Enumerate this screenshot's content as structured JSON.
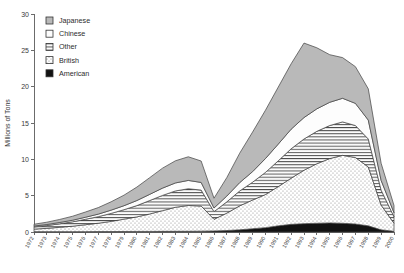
{
  "chart_data": {
    "type": "area",
    "stacked": true,
    "title": "",
    "xlabel": "",
    "ylabel": "Millions of Tons",
    "ylim": [
      0,
      30
    ],
    "yticks": [
      0,
      5,
      10,
      15,
      20,
      25,
      30
    ],
    "xlim": [
      1972,
      2000
    ],
    "grid": false,
    "legend_position": "top-left",
    "x": [
      1972,
      1973,
      1974,
      1975,
      1976,
      1977,
      1978,
      1979,
      1980,
      1981,
      1982,
      1983,
      1984,
      1985,
      1986,
      1987,
      1988,
      1989,
      1990,
      1991,
      1992,
      1993,
      1994,
      1995,
      1996,
      1997,
      1998,
      1999,
      2000
    ],
    "xtick_labels": [
      "1972",
      "1973",
      "1974",
      "1975",
      "1976",
      "1977",
      "1978",
      "1979",
      "1980",
      "1981",
      "1982",
      "1983",
      "1984",
      "1985",
      "1986",
      "1987",
      "1988",
      "1989",
      "1990",
      "1991",
      "1992",
      "1993",
      "1994",
      "1995",
      "1996",
      "1997",
      "1998",
      "1999",
      "2000"
    ],
    "series": [
      {
        "name": "American",
        "fill": "solid-black",
        "color": "#111111",
        "values": [
          0.05,
          0.05,
          0.05,
          0.05,
          0.05,
          0.06,
          0.06,
          0.07,
          0.08,
          0.08,
          0.09,
          0.1,
          0.1,
          0.12,
          0.15,
          0.2,
          0.3,
          0.45,
          0.6,
          0.85,
          1.05,
          1.15,
          1.2,
          1.25,
          1.2,
          1.1,
          0.85,
          0.3,
          0.1
        ]
      },
      {
        "name": "British",
        "fill": "dotted",
        "color": "#fefefe",
        "values": [
          0.35,
          0.45,
          0.6,
          0.75,
          0.95,
          1.15,
          1.4,
          1.7,
          2.0,
          2.4,
          2.85,
          3.3,
          3.55,
          3.45,
          1.6,
          2.4,
          3.3,
          3.95,
          4.55,
          5.4,
          6.35,
          7.35,
          8.2,
          8.85,
          9.35,
          9.15,
          8.1,
          3.4,
          1.1
        ]
      },
      {
        "name": "Other",
        "fill": "horizontal-lines",
        "color": "#f7f7f7",
        "values": [
          0.3,
          0.38,
          0.48,
          0.6,
          0.75,
          0.9,
          1.1,
          1.3,
          1.55,
          1.85,
          2.1,
          2.25,
          2.3,
          2.2,
          1.05,
          1.55,
          2.05,
          2.45,
          3.05,
          3.55,
          4.05,
          4.3,
          4.45,
          4.55,
          4.6,
          4.4,
          3.85,
          2.05,
          0.9
        ]
      },
      {
        "name": "Chinese",
        "fill": "plain-white",
        "color": "#ffffff",
        "values": [
          0.12,
          0.15,
          0.18,
          0.22,
          0.28,
          0.35,
          0.45,
          0.55,
          0.7,
          0.85,
          1.0,
          1.1,
          1.15,
          1.05,
          0.5,
          0.8,
          1.15,
          1.45,
          1.9,
          2.3,
          2.7,
          2.95,
          3.1,
          3.2,
          3.25,
          3.05,
          2.6,
          1.35,
          0.55
        ]
      },
      {
        "name": "Japanese",
        "fill": "gray",
        "color": "#b8b8b8",
        "values": [
          0.25,
          0.32,
          0.42,
          0.55,
          0.72,
          0.9,
          1.15,
          1.45,
          1.85,
          2.3,
          2.75,
          3.05,
          3.25,
          2.95,
          1.35,
          2.55,
          4.05,
          5.45,
          6.65,
          7.85,
          9.0,
          10.25,
          8.4,
          6.55,
          5.6,
          5.05,
          4.3,
          2.35,
          1.0
        ]
      }
    ],
    "legend_order_top_to_bottom": [
      "Japanese",
      "Chinese",
      "Other",
      "British",
      "American"
    ]
  }
}
